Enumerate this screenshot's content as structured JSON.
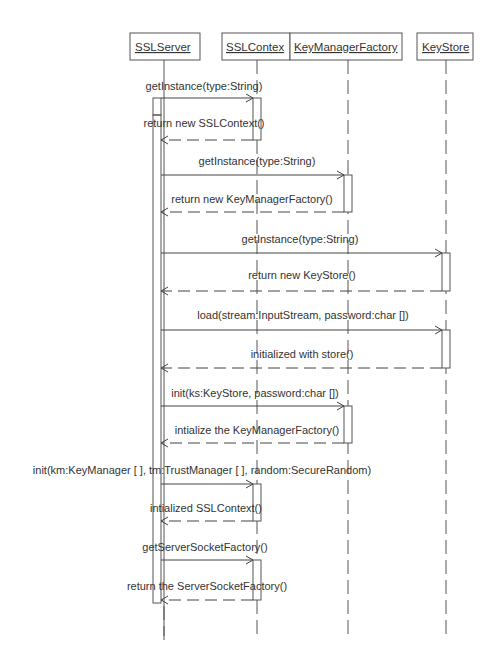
{
  "objects": [
    {
      "id": "sslserver",
      "label": "SSLServer",
      "x": 130,
      "w": 70,
      "lifeline_x": 164
    },
    {
      "id": "sslcontext",
      "label": "SSLContex",
      "x": 222,
      "w": 68,
      "lifeline_x": 257
    },
    {
      "id": "kmf",
      "label": "KeyManagerFactory",
      "x": 290,
      "w": 112,
      "lifeline_x": 348
    },
    {
      "id": "keystore",
      "label": "KeyStore",
      "x": 417,
      "w": 56,
      "lifeline_x": 446
    }
  ],
  "messages": [
    {
      "type": "call",
      "label": "getInstance(type:String)",
      "from": "sslserver",
      "to": "sslcontext",
      "y": 98,
      "label_x": 204,
      "label_y": 90
    },
    {
      "type": "return",
      "label": "return new SSLContext()",
      "from": "sslcontext",
      "to": "sslserver",
      "y": 140,
      "label_x": 204,
      "label_y": 127
    },
    {
      "type": "call",
      "label": "getInstance(type:String)",
      "from": "sslserver",
      "to": "kmf",
      "y": 175,
      "label_x": 257,
      "label_y": 165
    },
    {
      "type": "return",
      "label": "return new KeyManagerFactory()",
      "from": "kmf",
      "to": "sslserver",
      "y": 212,
      "label_x": 252,
      "label_y": 203
    },
    {
      "type": "call",
      "label": "getInstance(type:String)",
      "from": "sslserver",
      "to": "keystore",
      "y": 253,
      "label_x": 300,
      "label_y": 243
    },
    {
      "type": "return",
      "label": "return new KeyStore()",
      "from": "keystore",
      "to": "sslserver",
      "y": 291,
      "label_x": 302,
      "label_y": 279
    },
    {
      "type": "call",
      "label": "load(stream:InputStream, password:char [])",
      "from": "sslserver",
      "to": "keystore",
      "y": 330,
      "label_x": 303,
      "label_y": 319
    },
    {
      "type": "return",
      "label": "initialized with store()",
      "from": "keystore",
      "to": "sslserver",
      "y": 368,
      "label_x": 302,
      "label_y": 358
    },
    {
      "type": "call",
      "label": "init(ks:KeyStore, password:char [])",
      "from": "sslserver",
      "to": "kmf",
      "y": 406,
      "label_x": 255,
      "label_y": 397
    },
    {
      "type": "return",
      "label": "intialize the KeyManagerFactory()",
      "from": "kmf",
      "to": "sslserver",
      "y": 443,
      "label_x": 257,
      "label_y": 434
    },
    {
      "type": "call",
      "label": "init(km:KeyManager [ ], tm:TrustManager [ ], random:SecureRandom)",
      "from": "sslserver",
      "to": "sslcontext",
      "y": 484,
      "label_x": 202,
      "label_y": 474
    },
    {
      "type": "return",
      "label": "intialized SSLContext()",
      "from": "sslcontext",
      "to": "sslserver",
      "y": 521,
      "label_x": 206,
      "label_y": 512
    },
    {
      "type": "call",
      "label": "getServerSocketFactory()",
      "from": "sslserver",
      "to": "sslcontext",
      "y": 560,
      "label_x": 205,
      "label_y": 551
    },
    {
      "type": "return",
      "label": "return the ServerSocketFactory()",
      "from": "sslcontext",
      "to": "sslserver",
      "y": 600,
      "label_x": 207,
      "label_y": 590
    }
  ],
  "activations": [
    {
      "object": "sslserver",
      "x": 160,
      "y_top": 98,
      "y_bottom": 603
    },
    {
      "object": "sslserver-short",
      "x": 152,
      "y_top": 98,
      "y_bottom": 114
    },
    {
      "object": "sslcontext",
      "x": 252,
      "y_top": 98,
      "y_bottom": 140
    },
    {
      "object": "kmf",
      "x": 345,
      "y_top": 175,
      "y_bottom": 212
    },
    {
      "object": "keystore",
      "x": 442,
      "y_top": 253,
      "y_bottom": 291
    },
    {
      "object": "keystore",
      "x": 442,
      "y_top": 330,
      "y_bottom": 368
    },
    {
      "object": "kmf",
      "x": 345,
      "y_top": 406,
      "y_bottom": 443
    },
    {
      "object": "sslcontext",
      "x": 252,
      "y_top": 484,
      "y_bottom": 521
    },
    {
      "object": "sslcontext",
      "x": 252,
      "y_top": 560,
      "y_bottom": 600
    }
  ]
}
